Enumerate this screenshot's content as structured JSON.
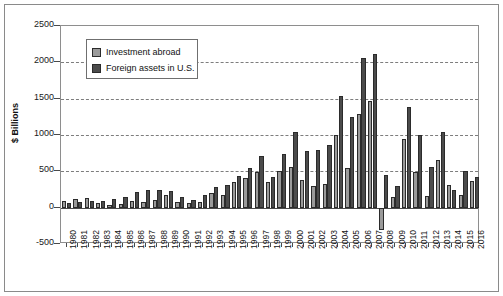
{
  "chart_data": {
    "type": "bar",
    "title": "",
    "xlabel": "",
    "ylabel": "$ Billions",
    "ylim": [
      -500,
      2500
    ],
    "yticks": [
      2500,
      2000,
      1500,
      1000,
      500,
      0,
      -500
    ],
    "grid": true,
    "legend_position": "top-left-inside",
    "categories": [
      "1980",
      "1981",
      "1982",
      "1983",
      "1984",
      "1985",
      "1986",
      "1987",
      "1988",
      "1989",
      "1990",
      "1991",
      "1992",
      "1993",
      "1994",
      "1995",
      "1996",
      "1997",
      "1998",
      "1999",
      "2000",
      "2001",
      "2002",
      "2003",
      "2004",
      "2005",
      "2006",
      "2007",
      "2008",
      "2009",
      "2010",
      "2011",
      "2012",
      "2013",
      "2014",
      "2015",
      "2016"
    ],
    "series": [
      {
        "name": "Investment abroad",
        "color": "#9a9a9a",
        "values": [
          86,
          114,
          127,
          66,
          40,
          44,
          98,
          79,
          107,
          169,
          81,
          64,
          74,
          201,
          178,
          352,
          413,
          488,
          353,
          504,
          561,
          383,
          294,
          325,
          1000,
          546,
          1286,
          1474,
          -310,
          150,
          946,
          487,
          160,
          650,
          312,
          180,
          365
        ]
      },
      {
        "name": "Foreign assets in U.S.",
        "color": "#4b4b4b",
        "values": [
          62,
          84,
          94,
          85,
          113,
          141,
          221,
          249,
          247,
          224,
          141,
          111,
          171,
          282,
          306,
          438,
          551,
          707,
          423,
          741,
          1047,
          783,
          795,
          858,
          1533,
          1247,
          2065,
          2108,
          454,
          305,
          1390,
          1001,
          560,
          1040,
          250,
          500,
          420
        ]
      }
    ]
  },
  "legend": {
    "items": [
      {
        "label": "Investment abroad"
      },
      {
        "label": "Foreign assets in U.S."
      }
    ]
  }
}
